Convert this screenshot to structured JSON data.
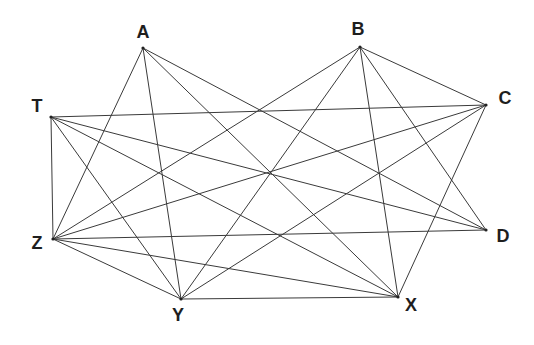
{
  "diagram": {
    "type": "graph",
    "title": "",
    "vertices": [
      {
        "id": "A",
        "label": "A",
        "x": 143,
        "y": 48,
        "lx": 143,
        "ly": 32
      },
      {
        "id": "B",
        "label": "B",
        "x": 360,
        "y": 47,
        "lx": 358,
        "ly": 29
      },
      {
        "id": "C",
        "label": "C",
        "x": 486,
        "y": 105,
        "lx": 505,
        "ly": 98
      },
      {
        "id": "D",
        "label": "D",
        "x": 486,
        "y": 230,
        "lx": 503,
        "ly": 236
      },
      {
        "id": "X",
        "label": "X",
        "x": 398,
        "y": 297,
        "lx": 411,
        "ly": 305
      },
      {
        "id": "Y",
        "label": "Y",
        "x": 181,
        "y": 299,
        "lx": 178,
        "ly": 315
      },
      {
        "id": "Z",
        "label": "Z",
        "x": 53,
        "y": 239,
        "lx": 37,
        "ly": 243
      },
      {
        "id": "T",
        "label": "T",
        "x": 51,
        "y": 117,
        "lx": 37,
        "ly": 106
      }
    ],
    "edges": [
      [
        "A",
        "Z"
      ],
      [
        "A",
        "Y"
      ],
      [
        "A",
        "X"
      ],
      [
        "A",
        "D"
      ],
      [
        "B",
        "Z"
      ],
      [
        "B",
        "Y"
      ],
      [
        "B",
        "X"
      ],
      [
        "B",
        "D"
      ],
      [
        "B",
        "C"
      ],
      [
        "C",
        "T"
      ],
      [
        "C",
        "Z"
      ],
      [
        "C",
        "Y"
      ],
      [
        "C",
        "X"
      ],
      [
        "D",
        "Z"
      ],
      [
        "D",
        "T"
      ],
      [
        "T",
        "X"
      ],
      [
        "T",
        "Y"
      ],
      [
        "T",
        "Z"
      ],
      [
        "Z",
        "X"
      ],
      [
        "Z",
        "Y"
      ],
      [
        "Y",
        "X"
      ]
    ],
    "colors": {
      "edge": "#3a3a3a",
      "label": "#1e1e1e",
      "background": "#ffffff"
    }
  }
}
